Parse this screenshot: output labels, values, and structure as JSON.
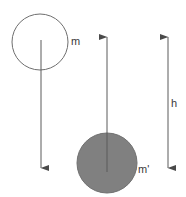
{
  "figure": {
    "background_color": "#ffffff",
    "stroke_color": "#6e6e6e",
    "arrow_color": "#555555",
    "label_color": "#3a3a3a",
    "shaded_fill_color": "#808080"
  },
  "labels": {
    "mass_upper": "m",
    "mass_lower": "m'",
    "height": "h"
  },
  "shapes": {
    "upper_circle": {
      "name": "open-circle-mass-m",
      "cx": 40,
      "cy": 42,
      "r": 28,
      "fill": "none",
      "stroke": "#6e6e6e"
    },
    "lower_circle": {
      "name": "shaded-circle-mass-m-prime",
      "cx": 107,
      "cy": 163,
      "r": 30,
      "fill": "#808080",
      "stroke": "#6e6e6e"
    }
  },
  "arrows": {
    "down_arrow_m": {
      "name": "downward-velocity-arrow",
      "x": 41,
      "y_start": 40,
      "y_end": 172,
      "direction": "down"
    },
    "up_arrow_m_prime": {
      "name": "upward-velocity-arrow",
      "x": 107,
      "y_start": 172,
      "y_end": 33,
      "direction": "up"
    },
    "height_dimension": {
      "name": "height-dimension-arrow",
      "x": 168,
      "y_top": 33,
      "y_bottom": 172,
      "direction": "both"
    }
  }
}
